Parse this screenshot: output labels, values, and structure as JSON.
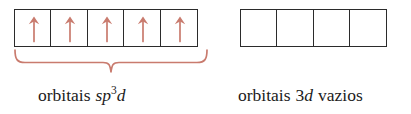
{
  "figure": {
    "type": "orbital-box-diagram",
    "colors": {
      "box_border": "#2b2b2b",
      "arrow": "#c97b6e",
      "brace": "#c97b6e",
      "text": "#1b1b1b",
      "background": "#ffffff"
    },
    "groups": [
      {
        "id": "sp3d-group",
        "box_count": 5,
        "electrons_per_box": 1,
        "arrow_direction": "up",
        "boxes": [
          {
            "index": 1,
            "arrow": "up-arrow",
            "occupied": true
          },
          {
            "index": 2,
            "arrow": "up-arrow",
            "occupied": true
          },
          {
            "index": 3,
            "arrow": "up-arrow",
            "occupied": true
          },
          {
            "index": 4,
            "arrow": "up-arrow",
            "occupied": true
          },
          {
            "index": 5,
            "arrow": "up-arrow",
            "occupied": true
          }
        ],
        "brace": {
          "visible": true,
          "style": "under-brace",
          "icon": "curly-brace-icon"
        },
        "caption": {
          "prefix": "orbitais",
          "orbital_s": "s",
          "orbital_p": "p",
          "exponent": "3",
          "orbital_d": "d",
          "full_text": "orbitais sp3d"
        }
      },
      {
        "id": "3d-empty-group",
        "box_count": 4,
        "electrons_per_box": 0,
        "arrow_direction": "none",
        "boxes": [
          {
            "index": 1,
            "arrow": "",
            "occupied": false
          },
          {
            "index": 2,
            "arrow": "",
            "occupied": false
          },
          {
            "index": 3,
            "arrow": "",
            "occupied": false
          },
          {
            "index": 4,
            "arrow": "",
            "occupied": false
          }
        ],
        "brace": {
          "visible": false,
          "style": "",
          "icon": ""
        },
        "caption": {
          "prefix": "orbitais",
          "level": "3",
          "orbital_d": "d",
          "suffix": "vazios",
          "full_text": "orbitais 3d vazios"
        }
      }
    ]
  }
}
